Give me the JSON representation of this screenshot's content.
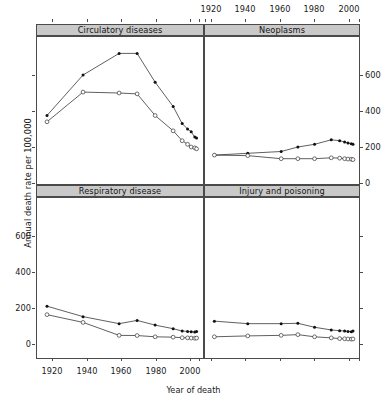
{
  "figure": {
    "ylabel": "Annual death rate per 100,000",
    "xlabel": "Year of death",
    "strip_circulatory": "Circulatory diseases",
    "strip_neoplasms": "Neoplasms",
    "strip_respiratory": "Respiratory disease",
    "strip_injury": "Injury and poisoning"
  },
  "axes": {
    "xticklabels": [
      "1920",
      "1940",
      "1960",
      "1980",
      "2000"
    ],
    "yticklabels": [
      "0",
      "200",
      "400",
      "600"
    ]
  },
  "chart_data": {
    "type": "line",
    "title": "",
    "xlabel": "Year of death",
    "ylabel": "Annual death rate per 100,000",
    "xlim": [
      1915,
      2006
    ],
    "ylim": [
      0,
      700
    ],
    "xticks": [
      1920,
      1940,
      1960,
      1980,
      2000
    ],
    "yticks": [
      0,
      200,
      400,
      600
    ],
    "grid": false,
    "legend": "none",
    "layout": "2x2 trellis panels",
    "series_markers": {
      "filled-circle": "higher series",
      "open-circle": "lower series"
    },
    "panels": [
      {
        "name": "Circulatory diseases",
        "position": "top-left",
        "series": [
          {
            "name": "filled-circle",
            "marker": "filled-circle",
            "x": [
              1920,
              1940,
              1960,
              1970,
              1980,
              1990,
              1995,
              1998,
              2000,
              2002,
              2003
            ],
            "values": [
              375,
              600,
              720,
              720,
              560,
              425,
              330,
              300,
              285,
              255,
              250
            ]
          },
          {
            "name": "open-circle",
            "marker": "open-circle",
            "x": [
              1920,
              1940,
              1960,
              1970,
              1980,
              1990,
              1995,
              1998,
              2000,
              2002,
              2003
            ],
            "values": [
              340,
              505,
              500,
              495,
              375,
              290,
              235,
              215,
              200,
              195,
              190
            ]
          }
        ]
      },
      {
        "name": "Neoplasms",
        "position": "top-right",
        "series": [
          {
            "name": "filled-circle",
            "marker": "filled-circle",
            "x": [
              1920,
              1940,
              1960,
              1970,
              1980,
              1990,
              1995,
              1998,
              2000,
              2002,
              2003
            ],
            "values": [
              155,
              165,
              175,
              200,
              215,
              240,
              235,
              228,
              222,
              218,
              215
            ]
          },
          {
            "name": "open-circle",
            "marker": "open-circle",
            "x": [
              1920,
              1940,
              1960,
              1970,
              1980,
              1990,
              1995,
              1998,
              2000,
              2002,
              2003
            ],
            "values": [
              155,
              152,
              135,
              135,
              135,
              140,
              138,
              135,
              133,
              132,
              130
            ]
          }
        ]
      },
      {
        "name": "Respiratory disease",
        "position": "bottom-left",
        "series": [
          {
            "name": "filled-circle",
            "marker": "filled-circle",
            "x": [
              1920,
              1940,
              1960,
              1970,
              1980,
              1990,
              1995,
              1998,
              2000,
              2002,
              2003
            ],
            "values": [
              210,
              152,
              113,
              131,
              105,
              85,
              72,
              70,
              68,
              66,
              70
            ]
          },
          {
            "name": "open-circle",
            "marker": "open-circle",
            "x": [
              1920,
              1940,
              1960,
              1970,
              1980,
              1990,
              1995,
              1998,
              2000,
              2002,
              2003
            ],
            "values": [
              163,
              120,
              48,
              47,
              40,
              38,
              35,
              34,
              33,
              32,
              33
            ]
          }
        ]
      },
      {
        "name": "Injury and poisoning",
        "position": "bottom-right",
        "series": [
          {
            "name": "filled-circle",
            "marker": "filled-circle",
            "x": [
              1920,
              1940,
              1960,
              1970,
              1980,
              1990,
              1995,
              1998,
              2000,
              2002,
              2003
            ],
            "values": [
              127,
              113,
              113,
              115,
              93,
              78,
              74,
              72,
              70,
              68,
              72
            ]
          },
          {
            "name": "open-circle",
            "marker": "open-circle",
            "x": [
              1920,
              1940,
              1960,
              1970,
              1980,
              1990,
              1995,
              1998,
              2000,
              2002,
              2003
            ],
            "values": [
              40,
              45,
              48,
              52,
              40,
              34,
              30,
              29,
              28,
              27,
              28
            ]
          }
        ]
      }
    ]
  }
}
